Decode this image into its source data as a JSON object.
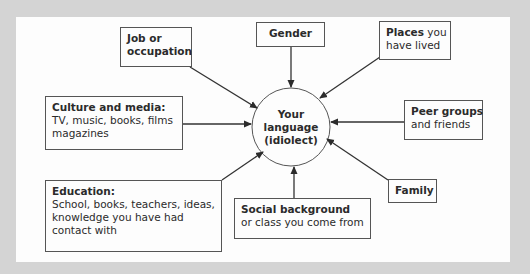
{
  "diagram": {
    "type": "hub-and-spoke influence diagram",
    "colors": {
      "outer_background": "#d4d4d4",
      "panel_background": "#fdfdfd",
      "stroke": "#555555",
      "text": "#2b2b2b"
    },
    "center": {
      "line1": "Your",
      "line2": "language",
      "line3": "(idiolect)"
    },
    "nodes": {
      "job": {
        "title": "Job or",
        "title2": "occupation",
        "detail": ""
      },
      "gender": {
        "title": "Gender",
        "detail": ""
      },
      "places": {
        "title": "Places",
        "detail_inline": " you",
        "detail": "have lived"
      },
      "peer": {
        "title": "Peer groups",
        "detail": "and friends"
      },
      "family": {
        "title": "Family",
        "detail": ""
      },
      "social": {
        "title": "Social background",
        "detail": "or class you come from"
      },
      "education": {
        "title": "Education:",
        "detail1": "School, books, teachers, ideas,",
        "detail2": "knowledge you have had",
        "detail3": "contact with"
      },
      "culture": {
        "title": "Culture and media:",
        "detail1": "TV, music, books, films",
        "detail2": "magazines"
      }
    },
    "edges": [
      {
        "from": "job",
        "to": "center"
      },
      {
        "from": "gender",
        "to": "center"
      },
      {
        "from": "places",
        "to": "center"
      },
      {
        "from": "peer",
        "to": "center"
      },
      {
        "from": "family",
        "to": "center"
      },
      {
        "from": "social",
        "to": "center"
      },
      {
        "from": "education",
        "to": "center"
      },
      {
        "from": "culture",
        "to": "center"
      }
    ]
  }
}
